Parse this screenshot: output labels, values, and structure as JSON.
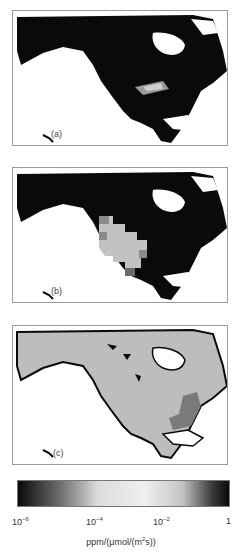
{
  "figure": {
    "panels": [
      {
        "label": "(a)",
        "description": "emission map, small bright region in central-north US"
      },
      {
        "label": "(b)",
        "description": "emission map, bright region over western US/Mexico"
      },
      {
        "label": "(c)",
        "description": "concentration map, light grey over continent, darker east coast"
      }
    ],
    "colorbar": {
      "ticks": [
        "10",
        "10",
        "10",
        "1"
      ],
      "tick_exponents": [
        "−6",
        "−4",
        "−2",
        ""
      ],
      "unit_prefix": "ppm/(μmol/(m",
      "unit_sup": "2",
      "unit_suffix": "s))",
      "colors": [
        "#0a0a0a",
        "#6e6e6e",
        "#dcdcdc",
        "#efefef",
        "#c4c4c4",
        "#3a3a3a",
        "#0a0a0a"
      ]
    }
  }
}
